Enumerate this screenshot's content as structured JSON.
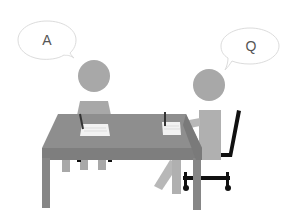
{
  "scene": {
    "description": "Interview illustration: two people at a table with speech bubbles",
    "colors": {
      "figure": "#a8a8a8",
      "figure_light": "#b8b8b8",
      "table_top": "#8e8e8e",
      "table_edge": "#7e7e7e",
      "paper": "#f2f2f2",
      "chair": "#111111",
      "bubble_stroke": "#dcdcdc"
    }
  },
  "bubbles": {
    "left": {
      "text": "A"
    },
    "right": {
      "text": "Q"
    }
  }
}
